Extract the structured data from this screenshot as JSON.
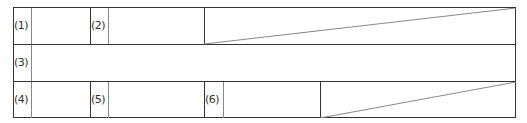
{
  "form_table": {
    "rows": [
      {
        "cells": [
          {
            "label": "(1)",
            "value": ""
          },
          {
            "label": "(2)",
            "value": ""
          },
          {
            "label": "",
            "value": "",
            "struck": true
          }
        ]
      },
      {
        "cells": [
          {
            "label": "(3)",
            "value": ""
          }
        ]
      },
      {
        "cells": [
          {
            "label": "(4)",
            "value": ""
          },
          {
            "label": "(5)",
            "value": ""
          },
          {
            "label": "(6)",
            "value": ""
          },
          {
            "label": "",
            "value": "",
            "struck": true
          }
        ]
      }
    ],
    "line_color": "#333333"
  }
}
